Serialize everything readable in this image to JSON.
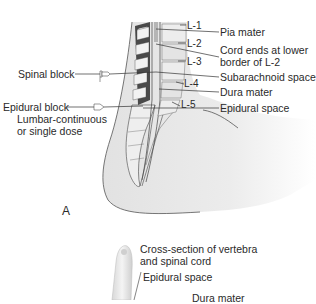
{
  "figure_a": {
    "panel_label": "A",
    "levels": [
      "L-1",
      "L-2",
      "L-3",
      "L-4",
      "L-5"
    ],
    "right_labels": {
      "pia_mater": "Pia mater",
      "cord_ends_1": "Cord ends at lower",
      "cord_ends_2": "border of L-2",
      "subarachnoid": "Subarachnoid space",
      "dura_mater": "Dura mater",
      "epidural_space": "Epidural space"
    },
    "left_labels": {
      "spinal_block": "Spinal block",
      "epidural_block": "Epidural block",
      "lumbar_1": "Lumbar-continuous",
      "lumbar_2": "or single dose"
    }
  },
  "figure_b": {
    "title_1": "Cross-section of vertebra",
    "title_2": "and spinal cord",
    "epidural_space": "Epidural space",
    "dura_mater": "Dura mater"
  },
  "colors": {
    "body_fill": "#e6e6e6",
    "vertebra_fill": "#f2f2f2",
    "disc_dark": "#4a4a4a",
    "line": "#333333"
  }
}
